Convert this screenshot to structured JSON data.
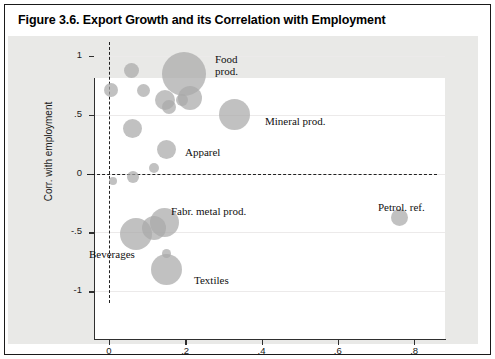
{
  "figure": {
    "title": "Figure 3.6. Export Growth and its Correlation with Employment"
  },
  "chart_data": {
    "type": "scatter",
    "title": "Figure 3.6. Export Growth and its Correlation with Employment",
    "xlabel": "(mean) GX_bar",
    "ylabel": "Corr. with employment",
    "xlim": [
      -0.06,
      0.86
    ],
    "ylim": [
      -1.1,
      1.12
    ],
    "xticks": [
      0,
      0.2,
      0.4,
      0.6,
      0.8
    ],
    "xticklabels": [
      "0",
      ".2",
      ".4",
      ".6",
      ".8"
    ],
    "yticks": [
      1,
      0.5,
      0,
      -0.5,
      -1
    ],
    "yticklabels": [
      "1",
      ".5",
      "0",
      "-.5",
      "-1"
    ],
    "grid": true,
    "legend": "none",
    "reference_lines": [
      {
        "orientation": "vertical",
        "value": 0,
        "style": "dashed"
      },
      {
        "orientation": "horizontal",
        "value": 0,
        "style": "dashed"
      }
    ],
    "marker": "bubble",
    "bubble_color": "#a9a9a9",
    "points": [
      {
        "label": "",
        "x": 0.058,
        "y": 0.875,
        "size": 7.5
      },
      {
        "label": "",
        "x": 0.005,
        "y": 0.715,
        "size": 7.0
      },
      {
        "label": "",
        "x": 0.092,
        "y": 0.705,
        "size": 6.5
      },
      {
        "label": "",
        "x": 0.148,
        "y": 0.628,
        "size": 10.0
      },
      {
        "label": "",
        "x": 0.158,
        "y": 0.565,
        "size": 7.0
      },
      {
        "label": "Food\nprod.",
        "x": 0.198,
        "y": 0.845,
        "size": 22.0
      },
      {
        "label": "",
        "x": 0.212,
        "y": 0.64,
        "size": 12.0
      },
      {
        "label": "",
        "x": 0.191,
        "y": 0.628,
        "size": 6.0
      },
      {
        "label": "Mineral prod.",
        "x": 0.33,
        "y": 0.5,
        "size": 15.5
      },
      {
        "label": "",
        "x": 0.062,
        "y": 0.385,
        "size": 9.5
      },
      {
        "label": "Apparel",
        "x": 0.152,
        "y": 0.205,
        "size": 9.5
      },
      {
        "label": "",
        "x": 0.012,
        "y": -0.06,
        "size": 4.0
      },
      {
        "label": "",
        "x": 0.062,
        "y": -0.032,
        "size": 6.0
      },
      {
        "label": "",
        "x": 0.118,
        "y": 0.045,
        "size": 5.0
      },
      {
        "label": "Fabr. metal prod.",
        "x": 0.146,
        "y": -0.415,
        "size": 14.5
      },
      {
        "label": "",
        "x": 0.118,
        "y": -0.462,
        "size": 12.0
      },
      {
        "label": "Beverages",
        "x": 0.07,
        "y": -0.512,
        "size": 16.0
      },
      {
        "label": "Textiles",
        "x": 0.152,
        "y": -0.812,
        "size": 15.5
      },
      {
        "label": "",
        "x": 0.152,
        "y": -0.682,
        "size": 4.5
      },
      {
        "label": "Petrol. ref.",
        "x": 0.762,
        "y": -0.375,
        "size": 8.5
      }
    ],
    "annotations": [
      {
        "text": "Food\nprod.",
        "x_px": 215,
        "y_px": 53
      },
      {
        "text": "Mineral prod.",
        "x_px": 265,
        "y_px": 115
      },
      {
        "text": "Apparel",
        "x_px": 185,
        "y_px": 146
      },
      {
        "text": "Fabr. metal prod.",
        "x_px": 171,
        "y_px": 205
      },
      {
        "text": "Beverages",
        "x_px": 89,
        "y_px": 248
      },
      {
        "text": "Textiles",
        "x_px": 194,
        "y_px": 274
      },
      {
        "text": "Petrol. ref.",
        "x_px": 378,
        "y_px": 201
      }
    ]
  }
}
